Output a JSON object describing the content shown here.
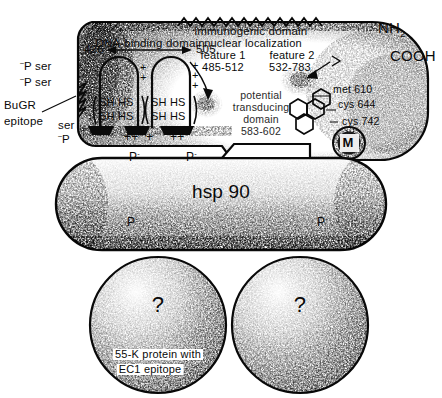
{
  "figure": {
    "type": "biology-schematic"
  },
  "receptor": {
    "immunogenic_domain": "immunogenic  domain",
    "dna_binding_domain": "DNA-binding  domain",
    "dna_start": "426",
    "dna_end": "505",
    "nuclear_localization": "nuclear localization",
    "nls_feature1_label": "feature 1",
    "nls_feature1_range": "485-512",
    "nls_feature2_label": "feature  2",
    "nls_feature2_range": "532-783",
    "transducing_line1": "potential",
    "transducing_line2": "transducing",
    "transducing_line3": "domain",
    "transducing_range": "583-602",
    "terminus_n": "NH",
    "terminus_n_sub": "2",
    "terminus_c": "COOH",
    "residues": [
      "met 610",
      "cys 644",
      "cys 742"
    ],
    "epitope_line1": "BuGR",
    "epitope_line2": "epitope",
    "phospho_ser_1_p": "P",
    "phospho_ser_1_label": "ser",
    "phospho_ser_2_p": "P",
    "phospho_ser_2_label": "ser",
    "phospho_ser_3_label": "ser",
    "phospho_ser_3_p": "P",
    "thiol_pairs": [
      "SH HS",
      "SH HS",
      "SH HS",
      "SH HS"
    ],
    "charges_top": [
      "+",
      "+",
      "+",
      "+",
      "+"
    ],
    "charges_bottom": [
      "++",
      "+",
      "++"
    ],
    "steroid_marker": "M"
  },
  "hsp90": {
    "label": "hsp 90",
    "phosphate_marks": [
      "P",
      "P",
      "P",
      "P"
    ],
    "phosphate_charge": "-"
  },
  "unknown_subunits": [
    {
      "mark": "?",
      "caption_line1": "55-K  protein  with",
      "caption_line2": "EC1 epitope"
    },
    {
      "mark": "?",
      "caption_line1": "",
      "caption_line2": ""
    }
  ],
  "colors": {
    "ink": "#0a0a0a",
    "paper": "#ffffff",
    "stipple": "#111111"
  }
}
